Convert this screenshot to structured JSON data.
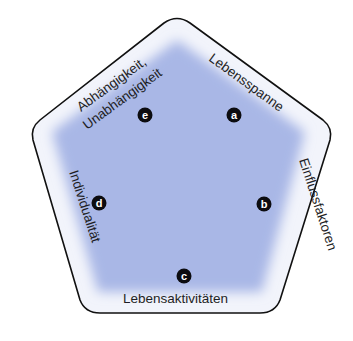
{
  "diagram": {
    "shape": "pentagon",
    "colors": {
      "fill_center": "#a9b7e6",
      "fill_edge": "#ffffff",
      "stroke": "#111111",
      "marker": "#0c0c10",
      "marker_text": "#ffffff",
      "label_text": "#1e1e24"
    },
    "markers": [
      {
        "id": "a",
        "letter": "a"
      },
      {
        "id": "b",
        "letter": "b"
      },
      {
        "id": "c",
        "letter": "c"
      },
      {
        "id": "d",
        "letter": "d"
      },
      {
        "id": "e",
        "letter": "e"
      }
    ],
    "labels": {
      "a": "Lebensspanne",
      "b": "Einflussfaktoren",
      "c": "Lebensaktivitäten",
      "d": "Individualität",
      "e_line1": "Abhängigkeit,",
      "e_line2": "Unabhängigkeit"
    }
  }
}
